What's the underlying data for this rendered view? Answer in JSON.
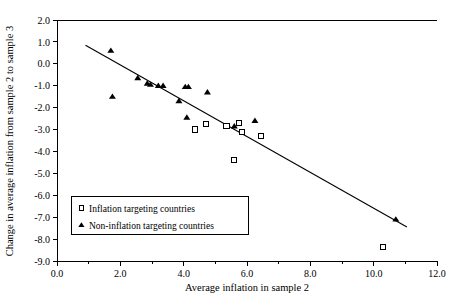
{
  "chart_data": {
    "type": "scatter",
    "title": "",
    "xlabel": "Average inflation in sample 2",
    "ylabel": "Change in average inflation from sample 2 to sample 3",
    "xlim": [
      0.0,
      12.0
    ],
    "ylim": [
      -9.0,
      2.0
    ],
    "x_ticks": [
      "0.0",
      "2.0",
      "4.0",
      "6.0",
      "8.0",
      "10.0",
      "12.0"
    ],
    "x_tick_values": [
      0.0,
      2.0,
      4.0,
      6.0,
      8.0,
      10.0,
      12.0
    ],
    "x_minor_step": 1.0,
    "y_ticks": [
      "2.0",
      "1.0",
      "0.0",
      "-1.0",
      "-2.0",
      "-3.0",
      "-4.0",
      "-5.0",
      "-6.0",
      "-7.0",
      "-8.0",
      "-9.0"
    ],
    "y_tick_values": [
      2.0,
      1.0,
      0.0,
      -1.0,
      -2.0,
      -3.0,
      -4.0,
      -5.0,
      -6.0,
      -7.0,
      -8.0,
      -9.0
    ],
    "grid": false,
    "legend_position": "lower-left",
    "series": [
      {
        "name": "Inflation targeting countries",
        "marker": "open-square",
        "points": [
          [
            4.35,
            -3.0
          ],
          [
            4.7,
            -2.75
          ],
          [
            5.35,
            -2.85
          ],
          [
            5.75,
            -2.7
          ],
          [
            5.85,
            -3.1
          ],
          [
            6.45,
            -3.3
          ],
          [
            5.6,
            -4.4
          ],
          [
            10.3,
            -8.35
          ]
        ]
      },
      {
        "name": "Non-inflation targeting countries",
        "marker": "filled-triangle",
        "points": [
          [
            1.7,
            0.6
          ],
          [
            1.75,
            -1.5
          ],
          [
            2.55,
            -0.65
          ],
          [
            2.85,
            -0.9
          ],
          [
            2.95,
            -0.95
          ],
          [
            3.2,
            -1.0
          ],
          [
            3.35,
            -1.0
          ],
          [
            4.05,
            -1.05
          ],
          [
            4.15,
            -1.05
          ],
          [
            4.75,
            -1.3
          ],
          [
            3.85,
            -1.7
          ],
          [
            4.1,
            -2.45
          ],
          [
            5.6,
            -2.85
          ],
          [
            6.25,
            -2.6
          ],
          [
            10.7,
            -7.1
          ]
        ]
      }
    ],
    "trendline": {
      "name": "fitted-regression-line",
      "x_start": 0.9,
      "y_start": 0.85,
      "x_end": 11.05,
      "y_end": -7.45
    }
  },
  "legend": {
    "entries": [
      {
        "label": "Inflation targeting countries",
        "marker": "open-square"
      },
      {
        "label": "Non-inflation targeting countries",
        "marker": "filled-triangle"
      }
    ]
  }
}
